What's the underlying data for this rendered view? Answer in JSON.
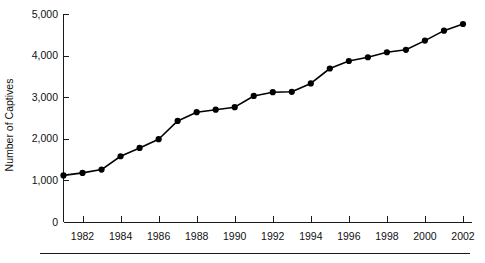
{
  "chart_data": {
    "type": "line",
    "title": "",
    "subtitle": "",
    "xlabel": "",
    "ylabel": "Number of Captives",
    "x": [
      1981,
      1982,
      1983,
      1984,
      1985,
      1986,
      1987,
      1988,
      1989,
      1990,
      1991,
      1992,
      1993,
      1994,
      1995,
      1996,
      1997,
      1998,
      1999,
      2000,
      2001,
      2002
    ],
    "values": [
      1120,
      1180,
      1260,
      1580,
      1780,
      1990,
      2430,
      2640,
      2700,
      2760,
      3030,
      3120,
      3130,
      3330,
      3690,
      3870,
      3960,
      4080,
      4140,
      4360,
      4600,
      4760
    ],
    "series": [
      {
        "name": "Number of Captives",
        "values": [
          1120,
          1180,
          1260,
          1580,
          1780,
          1990,
          2430,
          2640,
          2700,
          2760,
          3030,
          3120,
          3130,
          3330,
          3690,
          3870,
          3960,
          4080,
          4140,
          4360,
          4600,
          4760
        ]
      }
    ],
    "xlim": [
      1981,
      2002
    ],
    "ylim": [
      0,
      5000
    ],
    "ytick_values": [
      0,
      1000,
      2000,
      3000,
      4000,
      5000
    ],
    "ytick_labels": [
      "0",
      "1,000",
      "2,000",
      "3,000",
      "4,000",
      "5,000"
    ],
    "xtick_values": [
      1982,
      1984,
      1986,
      1988,
      1990,
      1992,
      1994,
      1996,
      1998,
      2000,
      2002
    ],
    "xtick_labels": [
      "1982",
      "1984",
      "1986",
      "1988",
      "1990",
      "1992",
      "1994",
      "1996",
      "1998",
      "2000",
      "2002"
    ],
    "xtick_minor_values": [
      1981,
      1983,
      1985,
      1987,
      1989,
      1991,
      1993,
      1995,
      1997,
      1999,
      2001
    ],
    "grid": false,
    "legend": false,
    "legend_position": "none",
    "marker": "filled-circle",
    "line_color": "#000000",
    "marker_color": "#000000",
    "axis_color": "#1a1a1a",
    "background_color": "#ffffff"
  }
}
